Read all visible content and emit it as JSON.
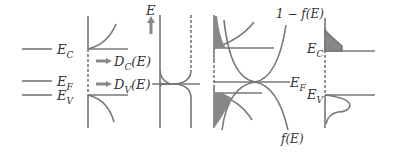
{
  "diagram": {
    "colors": {
      "line": "#777777",
      "fill": "#888888",
      "text": "#333333",
      "background": "#ffffff"
    },
    "levels_panel": {
      "labels": {
        "ec": {
          "main": "E",
          "sub": "C"
        },
        "ef": {
          "main": "E",
          "sub": "F"
        },
        "ev": {
          "main": "E",
          "sub": "V"
        }
      }
    },
    "dos_panel": {
      "arrow_labels": {
        "dc": {
          "main": "D",
          "sub": "C",
          "suffix": "(E)"
        },
        "dv": {
          "main": "D",
          "sub": "V",
          "suffix": "(E)"
        }
      }
    },
    "fermi_panel": {
      "energy_axis_label": "E"
    },
    "product_panel": {
      "top_curve_label": "1 − f(E)",
      "bottom_curve_label": "f(E)",
      "ef_label": {
        "main": "E",
        "sub": "F"
      }
    },
    "carrier_panel": {
      "labels": {
        "ec": {
          "main": "E",
          "sub": "C"
        },
        "ev": {
          "main": "E",
          "sub": "V"
        }
      }
    }
  }
}
